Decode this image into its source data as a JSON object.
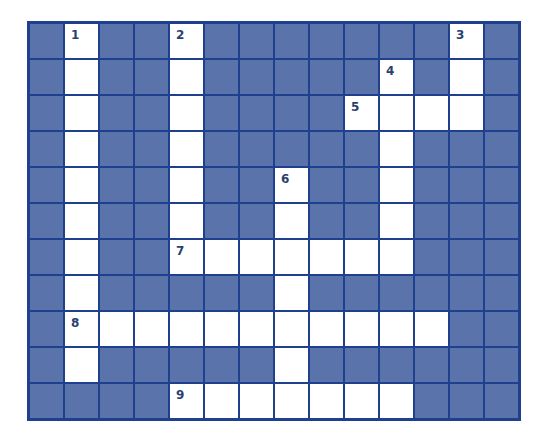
{
  "puzzle": {
    "type": "crossword",
    "columns": 14,
    "rows": 11,
    "colors": {
      "block": "#5b73ab",
      "open": "#ffffff",
      "gridline": "#1f3f8f",
      "number": "#2b3f6e"
    },
    "open_cells": [
      [
        0,
        1
      ],
      [
        0,
        4
      ],
      [
        0,
        12
      ],
      [
        1,
        1
      ],
      [
        1,
        4
      ],
      [
        1,
        10
      ],
      [
        1,
        12
      ],
      [
        2,
        1
      ],
      [
        2,
        4
      ],
      [
        2,
        9
      ],
      [
        2,
        10
      ],
      [
        2,
        11
      ],
      [
        2,
        12
      ],
      [
        3,
        1
      ],
      [
        3,
        4
      ],
      [
        3,
        10
      ],
      [
        4,
        1
      ],
      [
        4,
        4
      ],
      [
        4,
        7
      ],
      [
        4,
        10
      ],
      [
        5,
        1
      ],
      [
        5,
        4
      ],
      [
        5,
        7
      ],
      [
        5,
        10
      ],
      [
        6,
        1
      ],
      [
        6,
        4
      ],
      [
        6,
        5
      ],
      [
        6,
        6
      ],
      [
        6,
        7
      ],
      [
        6,
        8
      ],
      [
        6,
        9
      ],
      [
        6,
        10
      ],
      [
        7,
        1
      ],
      [
        7,
        7
      ],
      [
        8,
        1
      ],
      [
        8,
        2
      ],
      [
        8,
        3
      ],
      [
        8,
        4
      ],
      [
        8,
        5
      ],
      [
        8,
        6
      ],
      [
        8,
        7
      ],
      [
        8,
        8
      ],
      [
        8,
        9
      ],
      [
        8,
        10
      ],
      [
        8,
        11
      ],
      [
        9,
        1
      ],
      [
        9,
        7
      ],
      [
        10,
        4
      ],
      [
        10,
        5
      ],
      [
        10,
        6
      ],
      [
        10,
        7
      ],
      [
        10,
        8
      ],
      [
        10,
        9
      ],
      [
        10,
        10
      ]
    ],
    "numbers": [
      {
        "row": 0,
        "col": 1,
        "label": "1"
      },
      {
        "row": 0,
        "col": 4,
        "label": "2"
      },
      {
        "row": 0,
        "col": 12,
        "label": "3"
      },
      {
        "row": 1,
        "col": 10,
        "label": "4"
      },
      {
        "row": 2,
        "col": 9,
        "label": "5"
      },
      {
        "row": 4,
        "col": 7,
        "label": "6"
      },
      {
        "row": 6,
        "col": 4,
        "label": "7"
      },
      {
        "row": 8,
        "col": 1,
        "label": "8"
      },
      {
        "row": 10,
        "col": 4,
        "label": "9"
      }
    ],
    "entries": [
      {
        "label": "1",
        "direction": "down",
        "length": 10
      },
      {
        "label": "2",
        "direction": "down",
        "length": 7
      },
      {
        "label": "3",
        "direction": "down",
        "length": 3
      },
      {
        "label": "4",
        "direction": "down",
        "length": 6
      },
      {
        "label": "5",
        "direction": "across",
        "length": 4
      },
      {
        "label": "6",
        "direction": "down",
        "length": 6
      },
      {
        "label": "7",
        "direction": "across",
        "length": 7
      },
      {
        "label": "8",
        "direction": "across",
        "length": 11
      },
      {
        "label": "9",
        "direction": "across",
        "length": 7
      }
    ]
  }
}
